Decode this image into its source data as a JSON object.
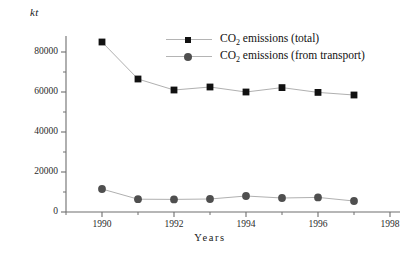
{
  "chart_data": {
    "type": "line",
    "title": "",
    "xlabel": "Years",
    "ylabel": "kt",
    "unit_label": "kt",
    "x": [
      1990,
      1991,
      1992,
      1993,
      1994,
      1995,
      1996,
      1997
    ],
    "xlim": [
      1989,
      1998
    ],
    "ylim": [
      0,
      88000
    ],
    "xticks": [
      1990,
      1992,
      1994,
      1996,
      1998
    ],
    "xtick_labels": [
      "1990",
      "1992",
      "1994",
      "1996",
      "1998"
    ],
    "xminorticks": [
      1989,
      1991,
      1993,
      1995,
      1997
    ],
    "yticks": [
      0,
      20000,
      40000,
      60000,
      80000
    ],
    "ytick_labels": [
      "0",
      "20000",
      "40000",
      "60000",
      "80000"
    ],
    "yminorticks": [
      10000,
      30000,
      50000,
      70000
    ],
    "grid": false,
    "legend_position": "upper-center",
    "series": [
      {
        "name": "CO2 emissions (total)",
        "label_main": "CO",
        "label_sub": "2",
        "label_rest": " emissions (total)",
        "marker": "square",
        "color": "#111111",
        "line_color": "#b0b0b0",
        "values": [
          85000,
          66500,
          61000,
          62500,
          60000,
          62200,
          59800,
          58500
        ]
      },
      {
        "name": "CO2 emissions (from transport)",
        "label_main": "CO",
        "label_sub": "2",
        "label_rest": " emissions (from transport)",
        "marker": "circle",
        "color": "#4f4f4f",
        "line_color": "#b0b0b0",
        "values": [
          11500,
          6400,
          6300,
          6500,
          8000,
          7000,
          7300,
          5500
        ]
      }
    ]
  }
}
